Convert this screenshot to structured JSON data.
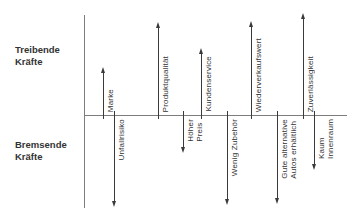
{
  "diagram": {
    "type": "force-field-analysis",
    "colors": {
      "background": "#ffffff",
      "axis": "#7d7d7d",
      "arrow": "#3a3a3a",
      "text": "#333333"
    },
    "left_labels": {
      "driving": "Treibende\nKräfte",
      "restraining": "Bremsende\nKräfte"
    },
    "baseline": {
      "y": 115,
      "x1": 84,
      "x2": 347
    },
    "axis": {
      "x": 84,
      "y1": 15,
      "y2": 208
    },
    "driving_forces": [
      {
        "label": "Marke",
        "x": 103,
        "tip_y": 67
      },
      {
        "label": "Produktqualität",
        "x": 158,
        "tip_y": 22
      },
      {
        "label": "Kundenservice",
        "x": 201,
        "tip_y": 48
      },
      {
        "label": "Wiederverkaufswert",
        "x": 251,
        "tip_y": 21
      },
      {
        "label": "Zuverlässigkeit",
        "x": 303,
        "tip_y": 13
      }
    ],
    "restraining_forces": [
      {
        "label": "Unfallrisiko",
        "x": 114,
        "tip_y": 207
      },
      {
        "label": "Höher\nPreis",
        "x": 183,
        "tip_y": 153
      },
      {
        "label": "Wenig Zubehör",
        "x": 227,
        "tip_y": 205
      },
      {
        "label": "Gute alternative\nAutos erhältlich",
        "x": 277,
        "tip_y": 204
      },
      {
        "label": "Kaum\nInnenraum",
        "x": 314,
        "tip_y": 170
      }
    ]
  }
}
